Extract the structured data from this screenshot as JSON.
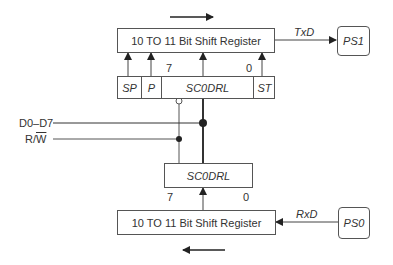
{
  "diagram": {
    "tx_shift_register": {
      "label": "10 TO 11 Bit Shift Register",
      "direction": "right"
    },
    "rx_shift_register": {
      "label": "10 TO 11 Bit Shift Register",
      "direction": "left"
    },
    "tx_buffer": {
      "cells": [
        "SP",
        "P",
        "SC0DRL",
        "ST"
      ],
      "bit_high": "7",
      "bit_low": "0"
    },
    "rx_buffer": {
      "label": "SC0DRL",
      "bit_high": "7",
      "bit_low": "0"
    },
    "ports": {
      "tx": {
        "label": "PS1",
        "signal": "TxD"
      },
      "rx": {
        "label": "PS0",
        "signal": "RxD"
      }
    },
    "inputs": {
      "data_bus": "D0–D7",
      "rw_prefix": "R/",
      "rw_bar": "W"
    }
  }
}
